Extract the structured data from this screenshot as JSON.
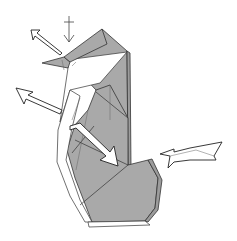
{
  "diagram": {
    "type": "origami-folding-step",
    "colors": {
      "paper_colored_side": "#a9a9a9",
      "paper_white_side": "#ffffff",
      "lines": "#333333",
      "background": "#ffffff"
    },
    "symbols": [
      {
        "name": "push-arrow",
        "description": "hollow push/sink arrow pointing at head from upper-left"
      },
      {
        "name": "valley-fold-arrow",
        "description": "thin vertical arrow pointing down onto head"
      },
      {
        "name": "unfold-arrow-left",
        "description": "hollow arrow pointing out to the left (pull/unfold)"
      },
      {
        "name": "push-arrow-body",
        "description": "hollow arrow pointing into body down-right"
      },
      {
        "name": "push-arrow-right",
        "description": "hollow push arrow pointing into body from right"
      }
    ]
  }
}
